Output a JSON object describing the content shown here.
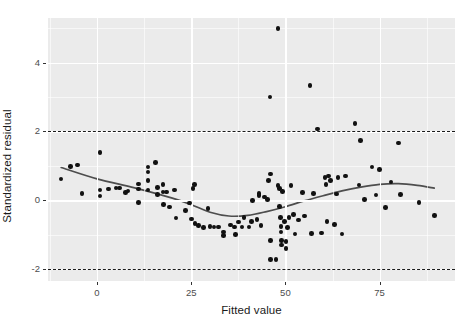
{
  "chart_data": {
    "type": "scatter",
    "title": "",
    "xlabel": "Fitted value",
    "ylabel": "Standardized residual",
    "xlim": [
      -13.0,
      95.0
    ],
    "ylim": [
      -2.35,
      5.3
    ],
    "xticks": [
      0,
      25,
      50,
      75
    ],
    "xtick_labels": [
      "0",
      "25",
      "50",
      "75"
    ],
    "yticks": [
      -2,
      0,
      2,
      4
    ],
    "ytick_labels": [
      "-2",
      "0",
      "2",
      "4"
    ],
    "grid": true,
    "grid_major_color": "#ffffff",
    "panel_background": "#ebebeb",
    "point_color": "#111111",
    "smooth_color": "#4d4d4d",
    "legend": "none",
    "reference_lines": [
      {
        "name": "upper-threshold",
        "y": 2,
        "style": "dashed",
        "color": "#1a1a1a"
      },
      {
        "name": "lower-threshold",
        "y": -2,
        "style": "dashed",
        "color": "#1a1a1a"
      }
    ],
    "points": [
      [
        -9.5,
        0.62
      ],
      [
        -7.0,
        0.98
      ],
      [
        -5.2,
        1.02
      ],
      [
        -4.0,
        0.2
      ],
      [
        0.8,
        1.38
      ],
      [
        0.8,
        0.3
      ],
      [
        0.8,
        0.12
      ],
      [
        3.0,
        0.33
      ],
      [
        5.0,
        0.36
      ],
      [
        6.0,
        0.35
      ],
      [
        7.6,
        0.22
      ],
      [
        8.2,
        0.27
      ],
      [
        11.0,
        0.47
      ],
      [
        11.0,
        0.33
      ],
      [
        11.0,
        -0.07
      ],
      [
        13.5,
        0.97
      ],
      [
        13.5,
        0.82
      ],
      [
        13.5,
        0.57
      ],
      [
        13.5,
        0.3
      ],
      [
        15.5,
        1.1
      ],
      [
        16.0,
        0.37
      ],
      [
        16.0,
        0.16
      ],
      [
        17.5,
        0.46
      ],
      [
        17.5,
        0.24
      ],
      [
        17.6,
        -0.13
      ],
      [
        18.5,
        0.24
      ],
      [
        19.3,
        -0.2
      ],
      [
        20.5,
        0.3
      ],
      [
        21.0,
        -0.52
      ],
      [
        23.5,
        -0.3
      ],
      [
        24.5,
        -0.08
      ],
      [
        25.5,
        0.34
      ],
      [
        25.8,
        0.46
      ],
      [
        25.0,
        -0.55
      ],
      [
        26.0,
        -0.68
      ],
      [
        27.0,
        -0.74
      ],
      [
        28.2,
        -0.8
      ],
      [
        29.5,
        -0.24
      ],
      [
        30.0,
        -0.76
      ],
      [
        31.0,
        -0.78
      ],
      [
        32.3,
        -0.78
      ],
      [
        33.5,
        -0.93
      ],
      [
        33.5,
        -1.02
      ],
      [
        35.5,
        -0.72
      ],
      [
        36.5,
        -0.78
      ],
      [
        36.7,
        -1.0
      ],
      [
        37.5,
        -0.63
      ],
      [
        38.5,
        -0.78
      ],
      [
        39.0,
        -0.5
      ],
      [
        40.3,
        -0.78
      ],
      [
        41.0,
        -0.62
      ],
      [
        41.2,
        0.0
      ],
      [
        42.5,
        -0.56
      ],
      [
        43.0,
        0.2
      ],
      [
        43.0,
        0.14
      ],
      [
        43.5,
        -0.73
      ],
      [
        44.5,
        0.09
      ],
      [
        45.3,
        0.02
      ],
      [
        45.5,
        0.58
      ],
      [
        45.9,
        3.0
      ],
      [
        46.0,
        0.76
      ],
      [
        46.0,
        -1.18
      ],
      [
        46.0,
        -1.72
      ],
      [
        47.5,
        -1.72
      ],
      [
        48.0,
        0.42
      ],
      [
        48.0,
        5.0
      ],
      [
        48.5,
        0.34
      ],
      [
        48.5,
        -0.18
      ],
      [
        48.7,
        -0.5
      ],
      [
        48.8,
        -0.76
      ],
      [
        48.8,
        -0.92
      ],
      [
        48.9,
        -1.18
      ],
      [
        49.0,
        -1.3
      ],
      [
        49.2,
        0.25
      ],
      [
        49.8,
        -0.62
      ],
      [
        50.2,
        -1.2
      ],
      [
        50.2,
        -1.4
      ],
      [
        50.5,
        -0.8
      ],
      [
        51.0,
        -0.5
      ],
      [
        51.5,
        0.43
      ],
      [
        52.2,
        -0.42
      ],
      [
        52.5,
        -0.98
      ],
      [
        53.5,
        -0.58
      ],
      [
        54.5,
        0.23
      ],
      [
        55.0,
        -0.46
      ],
      [
        56.5,
        3.34
      ],
      [
        57.0,
        -0.96
      ],
      [
        57.5,
        0.2
      ],
      [
        58.5,
        2.07
      ],
      [
        59.5,
        -0.95
      ],
      [
        60.5,
        0.66
      ],
      [
        60.8,
        0.46
      ],
      [
        61.0,
        -0.62
      ],
      [
        61.5,
        0.7
      ],
      [
        62.0,
        0.58
      ],
      [
        63.0,
        -0.7
      ],
      [
        63.5,
        0.18
      ],
      [
        64.0,
        0.66
      ],
      [
        65.0,
        -0.98
      ],
      [
        66.0,
        0.7
      ],
      [
        68.5,
        2.23
      ],
      [
        69.5,
        0.44
      ],
      [
        70.0,
        1.73
      ],
      [
        71.0,
        0.02
      ],
      [
        73.0,
        0.97
      ],
      [
        74.0,
        0.15
      ],
      [
        75.0,
        0.9
      ],
      [
        76.5,
        -0.22
      ],
      [
        78.0,
        0.53
      ],
      [
        80.0,
        1.66
      ],
      [
        80.5,
        0.17
      ],
      [
        85.5,
        -0.07
      ],
      [
        89.5,
        -0.45
      ]
    ],
    "smooth_line_x": [
      -9.5,
      0,
      10,
      20,
      25,
      30,
      35,
      40,
      45,
      50,
      55,
      60,
      65,
      70,
      75,
      80,
      85,
      89.5
    ],
    "smooth_line_y": [
      0.95,
      0.62,
      0.36,
      0.06,
      -0.13,
      -0.35,
      -0.46,
      -0.44,
      -0.33,
      -0.19,
      -0.02,
      0.13,
      0.27,
      0.38,
      0.46,
      0.48,
      0.43,
      0.35
    ]
  }
}
